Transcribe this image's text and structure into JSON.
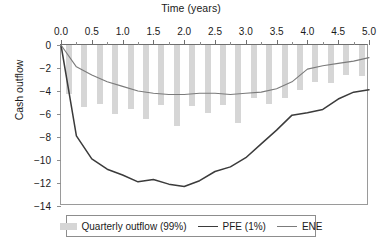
{
  "chart_data": {
    "type": "bar",
    "title": "Time (years)",
    "xlabel": "Time (years)",
    "ylabel": "Cash outflow",
    "xlim": [
      0.0,
      5.0
    ],
    "ylim": [
      -14,
      0
    ],
    "grid": false,
    "legend_position": "bottom",
    "xticks": [
      "0.0",
      "0.5",
      "1.0",
      "1.5",
      "2.0",
      "2.5",
      "3.0",
      "3.5",
      "4.0",
      "4.5",
      "5.0"
    ],
    "xtick_values": [
      0.0,
      0.5,
      1.0,
      1.5,
      2.0,
      2.5,
      3.0,
      3.5,
      4.0,
      4.5,
      5.0
    ],
    "yticks": [
      "0",
      "−2",
      "−4",
      "−6",
      "−8",
      "−10",
      "−12",
      "−14"
    ],
    "ytick_values": [
      0,
      -2,
      -4,
      -6,
      -8,
      -10,
      -12,
      -14
    ],
    "legend": [
      {
        "label": "Quarterly outflow (99%)",
        "marker": "bar",
        "color": "#d6d6d6"
      },
      {
        "label": "PFE (1%)",
        "marker": "line",
        "color": "#3b3b3b"
      },
      {
        "label": "ENE",
        "marker": "line",
        "color": "#7b7b7b"
      }
    ],
    "bars": {
      "name": "Quarterly outflow (99%)",
      "color": "#d6d6d6",
      "x": [
        0.13,
        0.38,
        0.63,
        0.88,
        1.13,
        1.38,
        1.63,
        1.88,
        2.13,
        2.38,
        2.63,
        2.88,
        3.13,
        3.38,
        3.63,
        3.88,
        4.13,
        4.38,
        4.63,
        4.88
      ],
      "values": [
        -4.3,
        -5.4,
        -5.1,
        -6.0,
        -5.6,
        -6.4,
        -5.2,
        -7.0,
        -5.3,
        -5.9,
        -5.2,
        -6.8,
        -4.6,
        -5.1,
        -4.6,
        -3.9,
        -3.2,
        -3.3,
        -2.6,
        -2.7
      ]
    },
    "series": [
      {
        "name": "PFE (1%)",
        "color": "#3b3b3b",
        "x": [
          0.0,
          0.25,
          0.5,
          0.75,
          1.0,
          1.25,
          1.5,
          1.75,
          2.0,
          2.25,
          2.5,
          2.75,
          3.0,
          3.25,
          3.5,
          3.75,
          4.0,
          4.25,
          4.5,
          4.75,
          5.0
        ],
        "values": [
          0.0,
          -7.9,
          -9.9,
          -10.8,
          -11.3,
          -11.9,
          -11.7,
          -12.1,
          -12.3,
          -11.8,
          -11.0,
          -10.6,
          -9.8,
          -8.6,
          -7.4,
          -6.1,
          -5.9,
          -5.6,
          -4.7,
          -4.1,
          -3.9
        ]
      },
      {
        "name": "ENE",
        "color": "#7b7b7b",
        "x": [
          0.0,
          0.25,
          0.5,
          0.75,
          1.0,
          1.25,
          1.5,
          1.75,
          2.0,
          2.25,
          2.5,
          2.75,
          3.0,
          3.25,
          3.5,
          3.75,
          4.0,
          4.25,
          4.5,
          4.75,
          5.0
        ],
        "values": [
          0.0,
          -1.9,
          -2.6,
          -3.2,
          -3.6,
          -4.0,
          -4.2,
          -4.3,
          -4.3,
          -4.2,
          -4.2,
          -4.3,
          -4.2,
          -4.1,
          -3.8,
          -3.2,
          -2.1,
          -1.8,
          -1.6,
          -1.4,
          -1.1
        ]
      }
    ]
  }
}
